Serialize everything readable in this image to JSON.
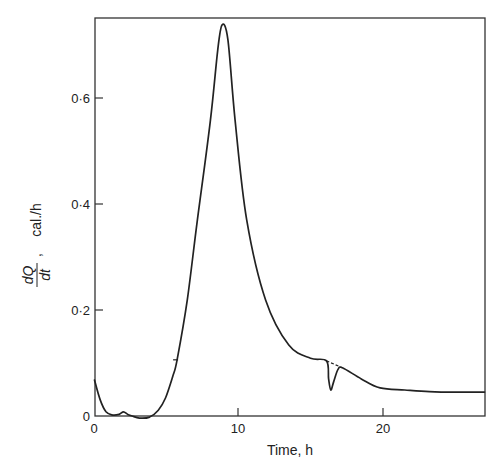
{
  "chart_data": {
    "type": "line",
    "title": "",
    "xlabel": "Time,  h",
    "ylabel": "dQ/dt ,  cal./h",
    "ylabel_parts": {
      "numerator": "dQ",
      "denominator": "dt",
      "unit": "cal./h"
    },
    "xlim": [
      0,
      27.1
    ],
    "ylim": [
      0,
      0.75
    ],
    "xticks": [
      0,
      10,
      20
    ],
    "xtick_labels": [
      "0",
      "10",
      "20"
    ],
    "yticks": [
      0,
      0.2,
      0.4,
      0.6
    ],
    "ytick_labels": [
      "0",
      "0·2",
      "0·4",
      "0·6"
    ],
    "grid": false,
    "legend": null,
    "series": [
      {
        "name": "heat flow",
        "x": [
          0.1,
          0.5,
          0.9,
          1.3,
          1.8,
          2.1,
          2.4,
          2.7,
          3.2,
          3.9,
          4.5,
          5.0,
          5.5,
          5.8,
          6.5,
          7.2,
          8.1,
          8.6,
          8.9,
          9.3,
          9.8,
          10.6,
          11.9,
          13.5,
          15.0,
          16.1,
          16.25,
          16.4,
          16.6,
          16.9,
          17.2,
          18.5,
          19.8,
          21.5,
          23.2,
          25.0,
          27.0
        ],
        "values": [
          0.068,
          0.03,
          0.008,
          0.002,
          0.003,
          0.008,
          0.003,
          0.0,
          -0.004,
          -0.002,
          0.011,
          0.034,
          0.075,
          0.106,
          0.219,
          0.37,
          0.558,
          0.69,
          0.738,
          0.71,
          0.558,
          0.37,
          0.219,
          0.134,
          0.109,
          0.104,
          0.07,
          0.049,
          0.065,
          0.088,
          0.091,
          0.07,
          0.053,
          0.049,
          0.046,
          0.045,
          0.045
        ]
      }
    ],
    "annotations": [
      {
        "type": "dashed-interpolation",
        "x": [
          16.1,
          17.2
        ],
        "values": [
          0.104,
          0.091
        ],
        "note": "dashed line bridging dip"
      },
      {
        "type": "tick-mark",
        "x": 5.8,
        "value": 0.106,
        "note": "small mark on rising curve"
      }
    ]
  },
  "style": {
    "line_color": "#222222",
    "axis_color": "#333333",
    "background": "#ffffff"
  }
}
